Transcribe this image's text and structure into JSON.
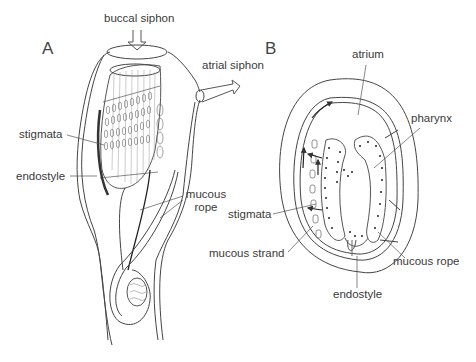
{
  "figure": {
    "panels": [
      {
        "id": "A",
        "label": "A"
      },
      {
        "id": "B",
        "label": "B"
      }
    ],
    "labels_A": {
      "buccal_siphon": "buccal siphon",
      "atrial_siphon": "atrial siphon",
      "stigmata": "stigmata",
      "endostyle": "endostyle",
      "mucous_rope_1": "mucous",
      "mucous_rope_2": "rope"
    },
    "labels_B": {
      "atrium": "atrium",
      "pharynx": "pharynx",
      "stigmata": "stigmata",
      "mucous_strand": "mucous strand",
      "mucous_rope": "mucous rope",
      "endostyle": "endostyle"
    },
    "colors": {
      "line": "#333333",
      "label": "#3a3a3a",
      "background": "#ffffff"
    }
  }
}
